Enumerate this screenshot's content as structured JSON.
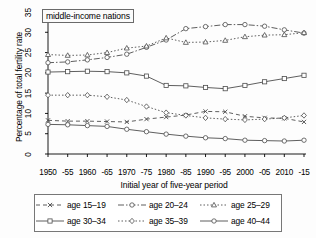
{
  "panel": {
    "title": "middle-income nations"
  },
  "axis": {
    "x_title": "Initial year of five-year period",
    "y_title": "Percentage of total fertility rate",
    "y_ticks": [
      "0",
      "5",
      "10",
      "15",
      "20",
      "25",
      "30",
      "35"
    ],
    "x_ticks": [
      "1950",
      "-55",
      "1960",
      "-65",
      "1970",
      "-75",
      "1980",
      "-85",
      "1990",
      "-95",
      "2000",
      "-05",
      "2010",
      "-15"
    ]
  },
  "legend": {
    "entries": [
      {
        "label": "age 15–19",
        "marker": "x",
        "dash": "4,3",
        "key": "legend-key-age-15-19"
      },
      {
        "label": "age 20–24",
        "marker": "circle",
        "dash": "6,2,1.5,2",
        "key": "legend-key-age-20-24"
      },
      {
        "label": "age 25–29",
        "marker": "triangle",
        "dash": "1.5,2",
        "key": "legend-key-age-25-29"
      },
      {
        "label": "age 30–34",
        "marker": "square",
        "dash": "none",
        "key": "legend-key-age-30-34"
      },
      {
        "label": "age 35–39",
        "marker": "diamond",
        "dash": "1.5,2",
        "key": "legend-key-age-35-39"
      },
      {
        "label": "age 40–44",
        "marker": "circle",
        "dash": "none",
        "key": "legend-key-age-40-44"
      }
    ]
  },
  "chart_data": {
    "type": "line",
    "title": "middle-income nations",
    "xlabel": "Initial year of five-year period",
    "ylabel": "Percentage of total fertility rate",
    "xlim": [
      0,
      13
    ],
    "ylim": [
      0,
      35
    ],
    "grid": false,
    "legend_position": "bottom",
    "categories": [
      "1950",
      "-55",
      "1960",
      "-65",
      "1970",
      "-75",
      "1980",
      "-85",
      "1990",
      "-95",
      "2000",
      "-05",
      "2010",
      "-15"
    ],
    "series": [
      {
        "name": "age 15–19",
        "marker": "x",
        "dash": "4,3",
        "color": "#4d4d4d",
        "values": [
          8.3,
          8.1,
          8.1,
          8.0,
          7.9,
          8.6,
          9.1,
          9.6,
          10.5,
          10.4,
          9.3,
          8.9,
          8.8,
          7.9
        ]
      },
      {
        "name": "age 20–24",
        "marker": "circle",
        "dash": "6,2,1.5,2",
        "color": "#4d4d4d",
        "values": [
          22.5,
          22.7,
          23.2,
          23.8,
          24.6,
          26.3,
          28.1,
          30.9,
          31.4,
          31.9,
          31.9,
          31.5,
          30.6,
          29.8
        ]
      },
      {
        "name": "age 25–29",
        "marker": "triangle",
        "dash": "1.5,2",
        "color": "#4d4d4d",
        "values": [
          24.5,
          24.3,
          24.4,
          25.0,
          26.1,
          26.6,
          28.6,
          27.5,
          27.6,
          28.0,
          28.9,
          29.3,
          29.4,
          29.9
        ]
      },
      {
        "name": "age 30–34",
        "marker": "square",
        "dash": "none",
        "color": "#4d4d4d",
        "values": [
          20.2,
          20.3,
          20.4,
          20.3,
          20.0,
          19.2,
          16.9,
          16.8,
          16.4,
          16.1,
          16.9,
          17.8,
          18.6,
          19.4
        ]
      },
      {
        "name": "age 35–39",
        "marker": "diamond",
        "dash": "1.5,2",
        "color": "#4d4d4d",
        "values": [
          14.5,
          14.5,
          14.5,
          14.1,
          13.3,
          11.7,
          10.2,
          9.5,
          8.9,
          8.6,
          8.4,
          8.6,
          8.9,
          9.5
        ]
      },
      {
        "name": "age 40–44",
        "marker": "circle",
        "dash": "none",
        "color": "#4d4d4d",
        "values": [
          7.3,
          7.2,
          7.0,
          6.8,
          6.1,
          5.5,
          4.9,
          4.4,
          4.0,
          3.8,
          3.4,
          3.3,
          3.2,
          3.4
        ]
      }
    ]
  }
}
